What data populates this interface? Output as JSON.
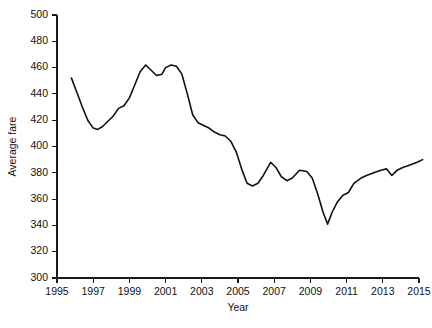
{
  "chart_data": {
    "type": "line",
    "title": "",
    "xlabel": "Year",
    "ylabel": "Average fare",
    "xlim": [
      1995,
      2015
    ],
    "ylim": [
      300,
      500
    ],
    "xticks": [
      1995,
      1997,
      1999,
      2001,
      2003,
      2005,
      2007,
      2009,
      2011,
      2013,
      2015
    ],
    "xtick_labels": [
      "1995",
      "1997",
      "1999",
      "2001",
      "2003",
      "2005",
      "2007",
      "2009",
      "2011",
      "2013",
      "2015"
    ],
    "yticks": [
      300,
      320,
      340,
      360,
      380,
      400,
      420,
      440,
      460,
      480,
      500
    ],
    "ytick_labels": [
      "300",
      "320",
      "340",
      "360",
      "380",
      "400",
      "420",
      "440",
      "460",
      "480",
      "500"
    ],
    "grid": false,
    "legend": "none",
    "line_color": "#111111",
    "axis_color": "#1a1a1a",
    "series": [
      {
        "name": "Average fare",
        "x": [
          1995.8,
          1996.1,
          1996.4,
          1996.7,
          1997.0,
          1997.25,
          1997.5,
          1997.8,
          1998.1,
          1998.4,
          1998.7,
          1999.0,
          1999.3,
          1999.6,
          1999.9,
          2000.2,
          2000.5,
          2000.8,
          2001.0,
          2001.3,
          2001.6,
          2001.9,
          2002.2,
          2002.5,
          2002.8,
          2003.1,
          2003.4,
          2003.7,
          2004.0,
          2004.3,
          2004.6,
          2004.9,
          2005.2,
          2005.5,
          2005.8,
          2006.1,
          2006.4,
          2006.8,
          2007.1,
          2007.4,
          2007.7,
          2008.0,
          2008.4,
          2008.8,
          2009.1,
          2009.4,
          2009.7,
          2009.95,
          2010.2,
          2010.5,
          2010.8,
          2011.1,
          2011.4,
          2011.8,
          2012.1,
          2012.5,
          2012.9,
          2013.2,
          2013.5,
          2013.8,
          2014.1,
          2014.5,
          2014.9,
          2015.2
        ],
        "values": [
          452,
          441,
          430,
          420,
          414,
          413,
          415,
          419,
          423,
          429,
          431,
          437,
          447,
          457,
          462,
          458,
          454,
          455,
          460,
          462,
          461,
          455,
          440,
          424,
          418,
          416,
          414,
          411,
          409,
          408,
          404,
          396,
          383,
          372,
          370,
          372,
          378,
          388,
          384,
          377,
          374,
          376,
          382,
          381,
          376,
          364,
          350,
          341,
          350,
          358,
          363,
          365,
          372,
          376,
          378,
          380,
          382,
          383,
          378,
          382,
          384,
          386,
          388,
          390
        ]
      }
    ],
    "notes": {
      "start_value": 452,
      "end_value": 390,
      "max_value": 462,
      "min_value": 341
    }
  },
  "geometry": {
    "plot_left": 57,
    "plot_right": 419,
    "plot_top": 15,
    "plot_bottom": 278
  }
}
